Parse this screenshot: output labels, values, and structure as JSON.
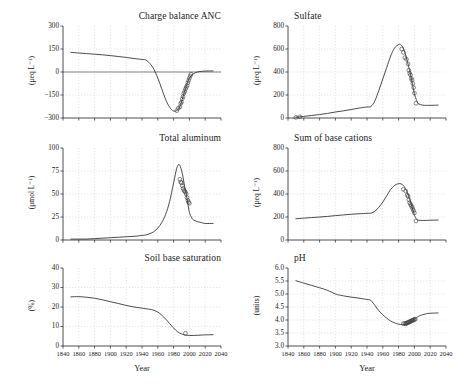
{
  "figure": {
    "xlabel": "Year",
    "xticks": [
      1840,
      1860,
      1880,
      1900,
      1920,
      1940,
      1960,
      1980,
      2000,
      2020,
      2040
    ],
    "xlim": [
      1840,
      2040
    ]
  },
  "chart_data": [
    {
      "id": "charge-balance-anc",
      "type": "line",
      "title": "Charge balance ANC",
      "xlabel": "Year",
      "ylabel": "(μeq L⁻¹)",
      "ylim": [
        -300,
        300
      ],
      "yticks": [
        -300,
        -150,
        0,
        150,
        300
      ],
      "xlim": [
        1840,
        2040
      ],
      "grid": true,
      "series": [
        {
          "name": "model",
          "x": [
            1850,
            1860,
            1870,
            1880,
            1890,
            1900,
            1910,
            1920,
            1930,
            1940,
            1945,
            1950,
            1955,
            1960,
            1965,
            1970,
            1975,
            1980,
            1985,
            1988,
            1990,
            1992,
            1995,
            1998,
            2000,
            2005,
            2010,
            2015,
            2020,
            2030
          ],
          "values": [
            128,
            124,
            120,
            116,
            112,
            107,
            101,
            95,
            88,
            82,
            78,
            55,
            18,
            -40,
            -110,
            -180,
            -230,
            -255,
            -248,
            -225,
            -195,
            -160,
            -110,
            -65,
            -40,
            -12,
            0,
            4,
            6,
            7
          ]
        }
      ],
      "observations": {
        "name": "observed",
        "x": [
          1984,
          1986,
          1988,
          1989,
          1990,
          1991,
          1992,
          1993,
          1994,
          1995,
          1996,
          1997,
          1998,
          1999,
          2000,
          2001,
          2002
        ],
        "values": [
          -252,
          -236,
          -228,
          -205,
          -196,
          -175,
          -160,
          -140,
          -128,
          -112,
          -100,
          -88,
          -70,
          -55,
          -40,
          -26,
          -14
        ]
      }
    },
    {
      "id": "sulfate",
      "type": "line",
      "title": "Sulfate",
      "xlabel": "Year",
      "ylabel": "(μeq L⁻¹)",
      "ylim": [
        0,
        800
      ],
      "yticks": [
        0,
        200,
        400,
        600,
        800
      ],
      "xlim": [
        1840,
        2040
      ],
      "grid": true,
      "series": [
        {
          "name": "model",
          "x": [
            1850,
            1860,
            1870,
            1880,
            1890,
            1900,
            1910,
            1920,
            1930,
            1940,
            1945,
            1950,
            1955,
            1960,
            1965,
            1970,
            1975,
            1980,
            1982,
            1985,
            1988,
            1990,
            1993,
            1995,
            1998,
            2000,
            2003,
            2005,
            2010,
            2015,
            2020,
            2030
          ],
          "values": [
            8,
            14,
            22,
            30,
            40,
            52,
            62,
            74,
            86,
            96,
            100,
            150,
            240,
            340,
            440,
            540,
            610,
            638,
            640,
            620,
            570,
            520,
            440,
            380,
            280,
            210,
            150,
            125,
            112,
            110,
            110,
            112
          ]
        }
      ],
      "observations": {
        "name": "observed",
        "x": [
          1850,
          1855,
          1984,
          1986,
          1988,
          1990,
          1992,
          1993,
          1994,
          1995,
          1996,
          1997,
          1998,
          1999,
          2000,
          2002
        ],
        "values": [
          5,
          10,
          600,
          570,
          525,
          510,
          470,
          415,
          390,
          375,
          345,
          330,
          300,
          265,
          215,
          128
        ]
      }
    },
    {
      "id": "total-aluminum",
      "type": "line",
      "title": "Total aluminum",
      "xlabel": "Year",
      "ylabel": "(μmol L⁻¹)",
      "ylim": [
        0,
        100
      ],
      "yticks": [
        0,
        25,
        50,
        75,
        100
      ],
      "xlim": [
        1840,
        2040
      ],
      "grid": true,
      "series": [
        {
          "name": "model",
          "x": [
            1850,
            1860,
            1870,
            1880,
            1890,
            1900,
            1910,
            1920,
            1930,
            1940,
            1945,
            1950,
            1955,
            1960,
            1965,
            1970,
            1975,
            1980,
            1984,
            1987,
            1990,
            1992,
            1994,
            1996,
            1998,
            2000,
            2003,
            2005,
            2010,
            2015,
            2020,
            2030
          ],
          "values": [
            1,
            1,
            1,
            1.5,
            2,
            2.5,
            3,
            3.5,
            4,
            5,
            5.5,
            7,
            9,
            13,
            19,
            28,
            42,
            62,
            78,
            82,
            76,
            68,
            58,
            50,
            40,
            30,
            24,
            22,
            20,
            19,
            18,
            18
          ]
        }
      ],
      "observations": {
        "name": "observed",
        "x": [
          1988,
          1989,
          1990,
          1991,
          1992,
          1993,
          1994,
          1995,
          1996,
          1997,
          1998,
          1999,
          2000
        ],
        "values": [
          66,
          63,
          62,
          59,
          56,
          54,
          53,
          52,
          50,
          46,
          43,
          41,
          40
        ]
      }
    },
    {
      "id": "sum-of-base-cations",
      "type": "line",
      "title": "Sum of base cations",
      "xlabel": "Year",
      "ylabel": "(μeq L⁻¹)",
      "ylim": [
        0,
        800
      ],
      "yticks": [
        0,
        200,
        400,
        600,
        800
      ],
      "xlim": [
        1840,
        2040
      ],
      "grid": true,
      "series": [
        {
          "name": "model",
          "x": [
            1850,
            1860,
            1870,
            1880,
            1890,
            1900,
            1910,
            1920,
            1930,
            1940,
            1945,
            1950,
            1955,
            1960,
            1965,
            1970,
            1975,
            1980,
            1983,
            1986,
            1988,
            1990,
            1993,
            1995,
            1998,
            2000,
            2003,
            2005,
            2010,
            2015,
            2020,
            2030
          ],
          "values": [
            185,
            190,
            195,
            200,
            205,
            212,
            218,
            224,
            228,
            232,
            234,
            250,
            285,
            330,
            385,
            440,
            475,
            490,
            488,
            475,
            455,
            430,
            375,
            335,
            265,
            215,
            180,
            172,
            170,
            170,
            172,
            173
          ]
        }
      ],
      "observations": {
        "name": "observed",
        "x": [
          1986,
          1989,
          1991,
          1992,
          1993,
          1994,
          1995,
          1996,
          1997,
          1998,
          1999,
          2000,
          2002
        ],
        "values": [
          440,
          425,
          390,
          380,
          350,
          325,
          310,
          300,
          285,
          270,
          255,
          235,
          165
        ]
      }
    },
    {
      "id": "soil-base-saturation",
      "type": "line",
      "title": "Soil base saturation",
      "xlabel": "Year",
      "ylabel": "(%)",
      "ylim": [
        0,
        40
      ],
      "yticks": [
        0,
        10,
        20,
        30,
        40
      ],
      "xlim": [
        1840,
        2040
      ],
      "grid": true,
      "series": [
        {
          "name": "model",
          "x": [
            1850,
            1860,
            1870,
            1880,
            1890,
            1900,
            1910,
            1920,
            1930,
            1940,
            1950,
            1955,
            1960,
            1965,
            1970,
            1975,
            1980,
            1985,
            1990,
            1993,
            1995,
            2000,
            2005,
            2010,
            2015,
            2020,
            2030
          ],
          "values": [
            25.2,
            25.3,
            25.0,
            24.5,
            23.7,
            22.7,
            21.8,
            20.8,
            20.0,
            19.4,
            18.8,
            18.3,
            17.4,
            15.8,
            13.8,
            11.5,
            9.2,
            7.3,
            6.2,
            5.8,
            5.6,
            5.4,
            5.4,
            5.5,
            5.6,
            5.7,
            5.8
          ]
        }
      ],
      "observations": {
        "name": "observed",
        "x": [
          1995
        ],
        "values": [
          6.5
        ]
      }
    },
    {
      "id": "ph",
      "type": "line",
      "title": "pH",
      "xlabel": "Year",
      "ylabel": "(units)",
      "ylim": [
        3.0,
        6.0
      ],
      "yticks": [
        3.0,
        3.5,
        4.0,
        4.5,
        5.0,
        5.5,
        6.0
      ],
      "ytick_labels": [
        "3.0",
        "3.5",
        "4.0",
        "4.5",
        "5.0",
        "5.5",
        "6.0"
      ],
      "xlim": [
        1840,
        2040
      ],
      "grid": true,
      "series": [
        {
          "name": "model",
          "x": [
            1850,
            1860,
            1870,
            1880,
            1890,
            1900,
            1905,
            1910,
            1920,
            1930,
            1940,
            1944,
            1946,
            1950,
            1955,
            1960,
            1965,
            1970,
            1975,
            1980,
            1985,
            1988,
            1990,
            1993,
            1995,
            1998,
            2000,
            2005,
            2010,
            2015,
            2020,
            2030
          ],
          "values": [
            5.51,
            5.42,
            5.33,
            5.24,
            5.14,
            5.0,
            4.96,
            4.93,
            4.88,
            4.84,
            4.79,
            4.77,
            4.72,
            4.56,
            4.36,
            4.2,
            4.07,
            3.96,
            3.89,
            3.84,
            3.82,
            3.83,
            3.85,
            3.89,
            3.93,
            3.99,
            4.04,
            4.14,
            4.2,
            4.24,
            4.26,
            4.27
          ]
        }
      ],
      "observations": {
        "name": "observed",
        "x": [
          1986,
          1988,
          1989,
          1990,
          1991,
          1992,
          1993,
          1994,
          1995,
          1996,
          1997,
          1998,
          1999,
          2000,
          2001
        ],
        "values": [
          3.86,
          3.87,
          3.85,
          3.88,
          3.89,
          3.9,
          3.92,
          3.93,
          3.95,
          3.96,
          3.98,
          3.99,
          4.01,
          4.02,
          4.03
        ]
      }
    }
  ]
}
